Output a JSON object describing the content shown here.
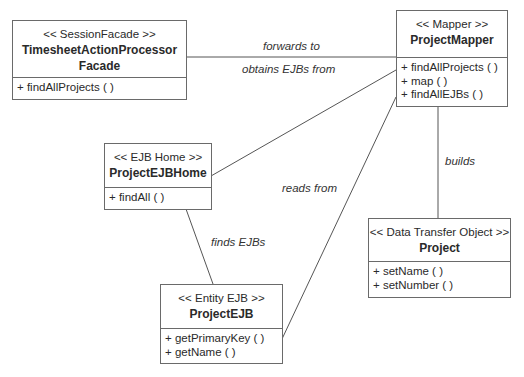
{
  "diagram": {
    "type": "UML class diagram",
    "classes": [
      {
        "id": "session_facade",
        "stereotype": "<< SessionFacade >>",
        "name_line1": "TimesheetActionProcessor",
        "name_line2": "Facade",
        "operations": [
          "+ findAllProjects ( )"
        ]
      },
      {
        "id": "mapper",
        "stereotype": "<< Mapper >>",
        "name": "ProjectMapper",
        "operations": [
          "+ findAllProjects ( )",
          "+ map ( )",
          "+ findAllEJBs ( )"
        ]
      },
      {
        "id": "ejb_home",
        "stereotype": "<< EJB Home >>",
        "name": "ProjectEJBHome",
        "operations": [
          "+ findAll ( )"
        ]
      },
      {
        "id": "dto",
        "stereotype": "<< Data Transfer Object >>",
        "name": "Project",
        "operations": [
          "+ setName ( )",
          "+ setNumber ( )"
        ]
      },
      {
        "id": "entity_ejb",
        "stereotype": "<< Entity EJB >>",
        "name": "ProjectEJB",
        "operations": [
          "+ getPrimaryKey ( )",
          "+ getName ( )"
        ]
      }
    ],
    "associations": [
      {
        "from": "session_facade",
        "to": "mapper",
        "label": "forwards to"
      },
      {
        "from": "mapper",
        "to": "ejb_home",
        "label": "obtains EJBs from"
      },
      {
        "from": "mapper",
        "to": "entity_ejb",
        "label": "reads from"
      },
      {
        "from": "mapper",
        "to": "dto",
        "label": "builds"
      },
      {
        "from": "ejb_home",
        "to": "entity_ejb",
        "label": "finds EJBs"
      }
    ]
  }
}
